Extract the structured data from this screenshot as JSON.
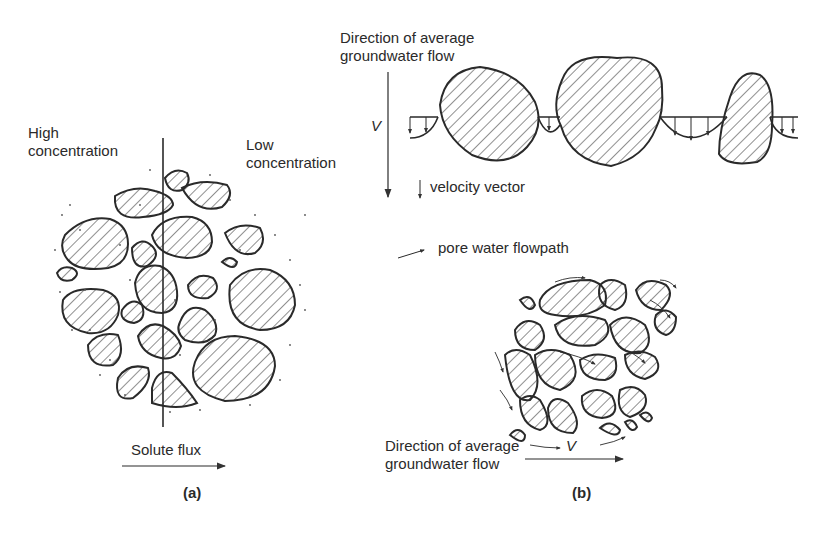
{
  "panel_a": {
    "label_high": [
      "High",
      "concentration"
    ],
    "label_low": [
      "Low",
      "concentration"
    ],
    "flux_label": "Solute flux",
    "caption": "(a)"
  },
  "panel_b": {
    "top_direction_label": [
      "Direction of average",
      "groundwater flow"
    ],
    "velocity_symbol": "V",
    "velocity_legend": "velocity vector",
    "flowpath_legend": "pore water flowpath",
    "bottom_direction_label": [
      "Direction of average",
      "groundwater flow"
    ],
    "bottom_velocity_symbol": "V",
    "caption": "(b)"
  },
  "colors": {
    "ink": "#2a2a2a",
    "background": "#ffffff"
  }
}
